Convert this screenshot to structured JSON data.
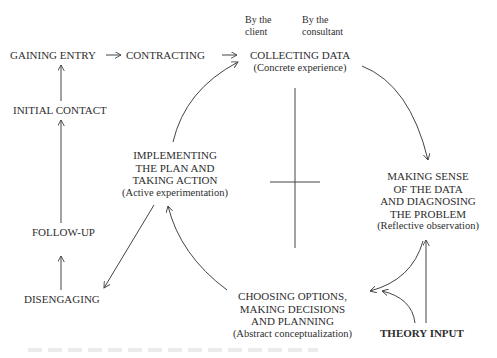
{
  "diagram": {
    "type": "consulting-cycle-flow",
    "legend": {
      "by_client": [
        "By the",
        "client"
      ],
      "by_consultant": [
        "By the",
        "consultant"
      ]
    },
    "left_stages": {
      "gaining_entry": "GAINING ENTRY",
      "contracting": "CONTRACTING",
      "initial_contact": "INITIAL CONTACT",
      "follow_up": "FOLLOW-UP",
      "disengaging": "DISENGAGING"
    },
    "cycle": {
      "collecting": {
        "lines": [
          "COLLECTING DATA"
        ],
        "sub": "(Concrete experience)"
      },
      "making_sense": {
        "lines": [
          "MAKING SENSE",
          "OF THE DATA",
          "AND DIAGNOSING",
          "THE PROBLEM"
        ],
        "sub": "(Reflective observation)"
      },
      "choosing": {
        "lines": [
          "CHOOSING OPTIONS,",
          "MAKING DECISIONS",
          "AND PLANNING"
        ],
        "sub": "(Abstract conceptualization)"
      },
      "implementing": {
        "lines": [
          "IMPLEMENTING",
          "THE PLAN AND",
          "TAKING ACTION"
        ],
        "sub": "(Active experimentation)"
      }
    },
    "theory_input": "THEORY INPUT",
    "line_color": "#444444"
  }
}
